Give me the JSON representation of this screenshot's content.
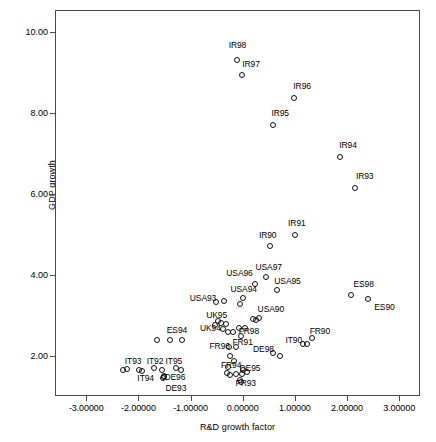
{
  "chart_data": {
    "type": "scatter",
    "title": "",
    "xlabel": "R&D growth factor",
    "ylabel": "GDP growth",
    "xlim": [
      -3.6,
      3.4
    ],
    "ylim": [
      1.0,
      10.55
    ],
    "grid": false,
    "legend": false,
    "xticks": [
      {
        "value": -3.0,
        "label": "-3.00000"
      },
      {
        "value": -2.0,
        "label": "-2.00000"
      },
      {
        "value": -1.0,
        "label": "-1.00000"
      },
      {
        "value": 0.0,
        "label": "0.00000"
      },
      {
        "value": 1.0,
        "label": "1.00000"
      },
      {
        "value": 2.0,
        "label": "2.00000"
      },
      {
        "value": 3.0,
        "label": "3.00000"
      }
    ],
    "yticks": [
      {
        "value": 2.0,
        "label": "2.00"
      },
      {
        "value": 4.0,
        "label": "4.00"
      },
      {
        "value": 6.0,
        "label": "6.00"
      },
      {
        "value": 8.0,
        "label": "8.00"
      },
      {
        "value": 10.0,
        "label": "10.00"
      }
    ],
    "marker": "open-circle",
    "marker_color": "#111111",
    "points": [
      {
        "label": "IR98",
        "x": -0.12,
        "y": 9.35,
        "lx": -0.12,
        "ly": 9.72
      },
      {
        "label": "IR97",
        "x": -0.04,
        "y": 8.97,
        "lx": 0.14,
        "ly": 9.25
      },
      {
        "label": "IR96",
        "x": 0.96,
        "y": 8.4,
        "lx": 1.12,
        "ly": 8.7
      },
      {
        "label": "IR95",
        "x": 0.56,
        "y": 7.72,
        "lx": 0.7,
        "ly": 8.02
      },
      {
        "label": "IR94",
        "x": 1.84,
        "y": 6.94,
        "lx": 2.0,
        "ly": 7.24
      },
      {
        "label": "IR93",
        "x": 2.14,
        "y": 6.18,
        "lx": 2.32,
        "ly": 6.48
      },
      {
        "label": "IR91",
        "x": 0.98,
        "y": 5.0,
        "lx": 1.02,
        "ly": 5.3
      },
      {
        "label": "IR90",
        "x": 0.5,
        "y": 4.74,
        "lx": 0.46,
        "ly": 5.0
      },
      {
        "label": "USA97",
        "x": 0.42,
        "y": 3.96,
        "lx": 0.48,
        "ly": 4.22
      },
      {
        "label": "USA96",
        "x": 0.22,
        "y": 3.8,
        "lx": -0.08,
        "ly": 4.08
      },
      {
        "label": "USA95",
        "x": 0.64,
        "y": 3.64,
        "lx": 0.84,
        "ly": 3.88
      },
      {
        "label": "USA94",
        "x": -0.02,
        "y": 3.46,
        "lx": 0.0,
        "ly": 3.66
      },
      {
        "label": "USA93",
        "x": -0.38,
        "y": 3.38,
        "lx": -0.78,
        "ly": 3.46
      },
      {
        "label": "ES98",
        "x": 2.06,
        "y": 3.52,
        "lx": 2.3,
        "ly": 3.8
      },
      {
        "label": "ES90",
        "x": 2.38,
        "y": 3.42,
        "lx": 2.7,
        "ly": 3.22
      },
      {
        "label": "USA90",
        "x": 0.24,
        "y": 2.9,
        "lx": 0.52,
        "ly": 3.18
      },
      {
        "label": "UK95",
        "x": -0.5,
        "y": 2.88,
        "lx": -0.52,
        "ly": 3.02
      },
      {
        "label": "UK94",
        "x": -0.4,
        "y": 2.68,
        "lx": -0.64,
        "ly": 2.7
      },
      {
        "label": "ES94",
        "x": -1.42,
        "y": 2.42,
        "lx": -1.28,
        "ly": 2.66
      },
      {
        "label": "FR98",
        "x": -0.06,
        "y": 2.52,
        "lx": 0.1,
        "ly": 2.64
      },
      {
        "label": "FR90",
        "x": 1.3,
        "y": 2.46,
        "lx": 1.46,
        "ly": 2.64
      },
      {
        "label": "IT90",
        "x": 1.14,
        "y": 2.32,
        "lx": 0.96,
        "ly": 2.42
      },
      {
        "label": "FR91",
        "x": -0.14,
        "y": 2.24,
        "lx": -0.02,
        "ly": 2.36
      },
      {
        "label": "FR96",
        "x": -0.28,
        "y": 2.24,
        "lx": -0.46,
        "ly": 2.26
      },
      {
        "label": "DE98",
        "x": 0.56,
        "y": 2.1,
        "lx": 0.38,
        "ly": 2.18
      },
      {
        "label": "IT93",
        "x": -2.24,
        "y": 1.7,
        "lx": -2.12,
        "ly": 1.88
      },
      {
        "label": "IT92",
        "x": -1.72,
        "y": 1.72,
        "lx": -1.7,
        "ly": 1.9
      },
      {
        "label": "IT95",
        "x": -1.3,
        "y": 1.72,
        "lx": -1.34,
        "ly": 1.9
      },
      {
        "label": "IT94",
        "x": -1.96,
        "y": 1.64,
        "lx": -1.88,
        "ly": 1.46
      },
      {
        "label": "DE96",
        "x": -1.52,
        "y": 1.52,
        "lx": -1.32,
        "ly": 1.5
      },
      {
        "label": "FR94",
        "x": -0.3,
        "y": 1.74,
        "lx": -0.24,
        "ly": 1.8
      },
      {
        "label": "DE95",
        "x": -0.02,
        "y": 1.66,
        "lx": 0.12,
        "ly": 1.72
      },
      {
        "label": "FR93",
        "x": -0.08,
        "y": 1.42,
        "lx": 0.04,
        "ly": 1.34
      },
      {
        "label": "DE93",
        "x": -1.52,
        "y": 1.5,
        "lx": -1.3,
        "ly": 1.22
      },
      {
        "label": "",
        "x": -0.44,
        "y": 2.82,
        "lx": null,
        "ly": null
      },
      {
        "label": "",
        "x": -0.34,
        "y": 2.8,
        "lx": null,
        "ly": null
      },
      {
        "label": "",
        "x": -0.3,
        "y": 2.62,
        "lx": null,
        "ly": null
      },
      {
        "label": "",
        "x": -0.2,
        "y": 2.6,
        "lx": null,
        "ly": null
      },
      {
        "label": "",
        "x": -0.1,
        "y": 2.7,
        "lx": null,
        "ly": null
      },
      {
        "label": "",
        "x": 0.02,
        "y": 2.7,
        "lx": null,
        "ly": null
      },
      {
        "label": "",
        "x": 0.18,
        "y": 2.94,
        "lx": null,
        "ly": null
      },
      {
        "label": "",
        "x": 0.3,
        "y": 2.96,
        "lx": null,
        "ly": null
      },
      {
        "label": "",
        "x": -0.56,
        "y": 2.78,
        "lx": null,
        "ly": null
      },
      {
        "label": "",
        "x": -1.66,
        "y": 2.4,
        "lx": null,
        "ly": null
      },
      {
        "label": "",
        "x": -1.18,
        "y": 2.4,
        "lx": null,
        "ly": null
      },
      {
        "label": "",
        "x": -0.54,
        "y": 3.36,
        "lx": null,
        "ly": null
      },
      {
        "label": "",
        "x": -0.08,
        "y": 3.3,
        "lx": null,
        "ly": null
      },
      {
        "label": "",
        "x": -0.26,
        "y": 2.02,
        "lx": null,
        "ly": null
      },
      {
        "label": "",
        "x": -0.18,
        "y": 1.88,
        "lx": null,
        "ly": null
      },
      {
        "label": "",
        "x": -0.32,
        "y": 1.6,
        "lx": null,
        "ly": null
      },
      {
        "label": "",
        "x": -0.26,
        "y": 1.54,
        "lx": null,
        "ly": null
      },
      {
        "label": "",
        "x": -0.14,
        "y": 1.58,
        "lx": null,
        "ly": null
      },
      {
        "label": "",
        "x": -0.04,
        "y": 1.56,
        "lx": null,
        "ly": null
      },
      {
        "label": "",
        "x": 0.06,
        "y": 1.62,
        "lx": null,
        "ly": null
      },
      {
        "label": "",
        "x": -0.06,
        "y": 1.36,
        "lx": null,
        "ly": null
      },
      {
        "label": "",
        "x": 0.7,
        "y": 2.02,
        "lx": null,
        "ly": null
      },
      {
        "label": "",
        "x": 1.22,
        "y": 2.3,
        "lx": null,
        "ly": null
      },
      {
        "label": "",
        "x": -2.32,
        "y": 1.66,
        "lx": null,
        "ly": null
      },
      {
        "label": "",
        "x": -2.0,
        "y": 1.68,
        "lx": null,
        "ly": null
      },
      {
        "label": "",
        "x": -1.56,
        "y": 1.68,
        "lx": null,
        "ly": null
      },
      {
        "label": "",
        "x": -1.2,
        "y": 1.66,
        "lx": null,
        "ly": null
      },
      {
        "label": "",
        "x": -1.54,
        "y": 1.48,
        "lx": null,
        "ly": null
      }
    ]
  }
}
